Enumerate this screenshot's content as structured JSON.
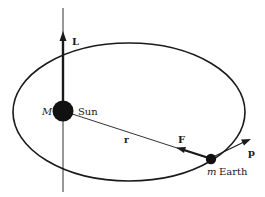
{
  "diagram": {
    "type": "orbital-mechanics",
    "colors": {
      "ink": "#1a1a1a",
      "background": "#ffffff"
    },
    "labels": {
      "angular_momentum": "L",
      "sun_mass": "M",
      "sun": "Sun",
      "radius_vector": "r",
      "force": "F",
      "momentum": "p",
      "earth_mass": "m",
      "earth": "Earth"
    },
    "elements": {
      "orbit": {
        "shape": "ellipse",
        "cx": 129,
        "cy": 112,
        "rx": 116,
        "ry": 69
      },
      "axis_line": {
        "x": 63,
        "y1": 8,
        "y2": 192
      },
      "sun": {
        "cx": 63,
        "cy": 111,
        "r": 10
      },
      "earth": {
        "cx": 211,
        "cy": 159,
        "r": 5
      }
    }
  }
}
